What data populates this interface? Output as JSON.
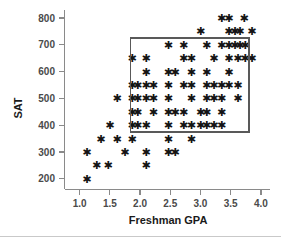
{
  "chart_data": {
    "type": "scatter",
    "title": "",
    "xlabel": "Freshman GPA",
    "ylabel": "SAT",
    "xlim": [
      0.75,
      4.15
    ],
    "ylim": [
      160,
      830
    ],
    "xticks": [
      "1.0",
      "1.5",
      "2.0",
      "2.5",
      "3.0",
      "3.5",
      "4.0"
    ],
    "xtick_values": [
      1.0,
      1.5,
      2.0,
      2.5,
      3.0,
      3.5,
      4.0
    ],
    "yticks": [
      "200",
      "300",
      "400",
      "500",
      "600",
      "700",
      "800"
    ],
    "ytick_values": [
      200,
      300,
      400,
      500,
      600,
      700,
      800
    ],
    "grid": false,
    "legend": null,
    "marker": "star",
    "marker_color": "#141414",
    "points": [
      [
        1.12,
        200
      ],
      [
        1.12,
        300
      ],
      [
        1.28,
        250
      ],
      [
        1.35,
        350
      ],
      [
        1.47,
        250
      ],
      [
        1.5,
        400
      ],
      [
        1.62,
        350
      ],
      [
        1.62,
        500
      ],
      [
        1.75,
        300
      ],
      [
        1.87,
        350
      ],
      [
        1.87,
        400
      ],
      [
        1.87,
        450
      ],
      [
        1.87,
        500
      ],
      [
        1.87,
        550
      ],
      [
        1.87,
        650
      ],
      [
        1.96,
        450
      ],
      [
        1.96,
        550
      ],
      [
        1.96,
        400
      ],
      [
        1.96,
        500
      ],
      [
        2.1,
        250
      ],
      [
        2.1,
        300
      ],
      [
        2.1,
        400
      ],
      [
        2.1,
        500
      ],
      [
        2.1,
        600
      ],
      [
        2.1,
        650
      ],
      [
        2.1,
        550
      ],
      [
        2.22,
        450
      ],
      [
        2.22,
        500
      ],
      [
        2.22,
        550
      ],
      [
        2.47,
        300
      ],
      [
        2.47,
        350
      ],
      [
        2.47,
        400
      ],
      [
        2.47,
        450
      ],
      [
        2.47,
        500
      ],
      [
        2.47,
        550
      ],
      [
        2.47,
        600
      ],
      [
        2.47,
        700
      ],
      [
        2.58,
        300
      ],
      [
        2.58,
        450
      ],
      [
        2.58,
        600
      ],
      [
        2.72,
        400
      ],
      [
        2.72,
        450
      ],
      [
        2.72,
        550
      ],
      [
        2.72,
        650
      ],
      [
        2.72,
        700
      ],
      [
        2.85,
        350
      ],
      [
        2.85,
        400
      ],
      [
        2.85,
        500
      ],
      [
        2.85,
        550
      ],
      [
        2.85,
        600
      ],
      [
        2.85,
        650
      ],
      [
        3.0,
        450
      ],
      [
        3.0,
        750
      ],
      [
        3.0,
        400
      ],
      [
        3.1,
        400
      ],
      [
        3.1,
        450
      ],
      [
        3.1,
        500
      ],
      [
        3.1,
        550
      ],
      [
        3.1,
        600
      ],
      [
        3.1,
        700
      ],
      [
        3.22,
        400
      ],
      [
        3.22,
        500
      ],
      [
        3.22,
        550
      ],
      [
        3.22,
        650
      ],
      [
        3.35,
        400
      ],
      [
        3.35,
        450
      ],
      [
        3.35,
        500
      ],
      [
        3.35,
        550
      ],
      [
        3.35,
        700
      ],
      [
        3.35,
        800
      ],
      [
        3.47,
        550
      ],
      [
        3.47,
        600
      ],
      [
        3.47,
        650
      ],
      [
        3.47,
        700
      ],
      [
        3.47,
        750
      ],
      [
        3.47,
        800
      ],
      [
        3.57,
        700
      ],
      [
        3.57,
        750
      ],
      [
        3.62,
        500
      ],
      [
        3.62,
        550
      ],
      [
        3.62,
        650
      ],
      [
        3.65,
        700
      ],
      [
        3.65,
        750
      ],
      [
        3.72,
        800
      ],
      [
        3.74,
        650
      ],
      [
        3.74,
        700
      ],
      [
        3.85,
        650
      ],
      [
        3.85,
        750
      ]
    ],
    "annotations": [
      {
        "type": "selection-rectangle",
        "name": "selection-box",
        "x_range": [
          1.84,
          3.8
        ],
        "y_range": [
          375,
          725
        ],
        "stroke_color": "#595959"
      }
    ]
  }
}
